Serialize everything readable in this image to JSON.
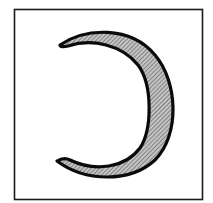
{
  "figure": {
    "frame": {
      "stroke": "#1a1a1a"
    },
    "crescent": {
      "fill_base": "#bdbdbd",
      "hatch_color": "#5a5a5a",
      "outline": "#0a0a0a",
      "hatch_pattern": "diagonal-lines"
    },
    "background": "#ffffff"
  }
}
